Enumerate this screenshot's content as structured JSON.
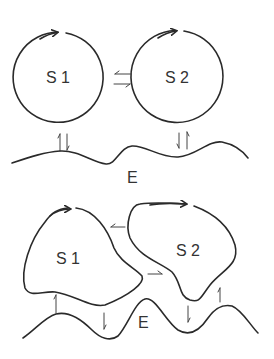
{
  "diagram": {
    "top_panel": {
      "systems": [
        {
          "id": "S1",
          "label": "S 1",
          "shape": "circle"
        },
        {
          "id": "S2",
          "label": "S 2",
          "shape": "circle"
        }
      ],
      "environment_label": "E",
      "exchanges": [
        {
          "from": "S1",
          "to": "S2",
          "type": "bidirectional"
        },
        {
          "from": "S1",
          "to": "E",
          "type": "bidirectional"
        },
        {
          "from": "S2",
          "to": "E",
          "type": "bidirectional"
        }
      ]
    },
    "bottom_panel": {
      "systems": [
        {
          "id": "S1",
          "label": "S 1",
          "shape": "irregular blob"
        },
        {
          "id": "S2",
          "label": "S 2",
          "shape": "irregular blob"
        }
      ],
      "environment_label": "E",
      "exchanges": [
        {
          "from": "S2",
          "to": "S1",
          "type": "unidirectional"
        },
        {
          "from": "S1",
          "to": "S2",
          "type": "unidirectional"
        },
        {
          "from": "E",
          "to": "S1",
          "type": "unidirectional"
        },
        {
          "from": "S1",
          "to": "E",
          "type": "unidirectional"
        },
        {
          "from": "S2",
          "to": "E",
          "type": "unidirectional"
        },
        {
          "from": "E",
          "to": "S2",
          "type": "unidirectional"
        }
      ]
    }
  }
}
